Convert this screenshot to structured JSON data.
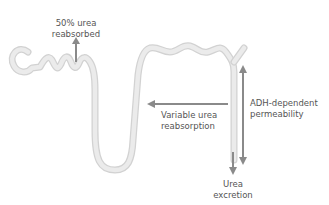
{
  "diagram": {
    "colors": {
      "tubule": "#e3e3e3",
      "tubule_edge": "#d4d4d4",
      "arrow": "#8a8a8a",
      "text": "#555555",
      "background": "#ffffff"
    },
    "labels": {
      "proximal": {
        "line1": "50% urea",
        "line2": "reabsorbed"
      },
      "distal": {
        "line1": "Variable urea",
        "line2": "reabsorption"
      },
      "collecting": {
        "line1": "ADH-dependent",
        "line2": "permeability"
      },
      "excretion": {
        "line1": "Urea",
        "line2": "excretion"
      }
    },
    "arrows": [
      {
        "id": "proximal-reabsorption",
        "direction": "up"
      },
      {
        "id": "variable-reabsorption",
        "direction": "left"
      },
      {
        "id": "adh-permeability",
        "direction": "up-and-down"
      },
      {
        "id": "urea-excretion",
        "direction": "down"
      }
    ]
  }
}
